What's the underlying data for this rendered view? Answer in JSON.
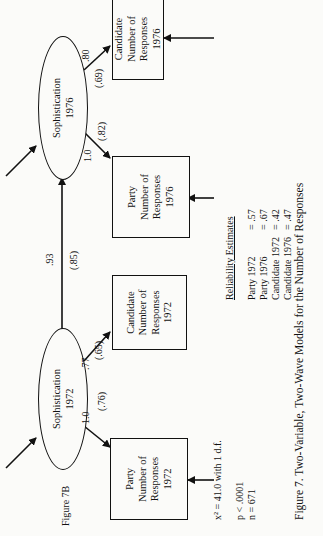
{
  "figure_label": "Figure 7B",
  "nodes": {
    "soph1972": {
      "line1": "Sophistication",
      "line2": "1972"
    },
    "soph1976": {
      "line1": "Sophistication",
      "line2": "1976"
    },
    "party1972": {
      "line1": "Party",
      "line2": "Number of",
      "line3": "Responses",
      "line4": "1972"
    },
    "cand1972": {
      "line1": "Candidate",
      "line2": "Number of",
      "line3": "Responses",
      "line4": "1972"
    },
    "party1976": {
      "line1": "Party",
      "line2": "Number of",
      "line3": "Responses",
      "line4": "1976"
    },
    "cand1976": {
      "line1": "Candidate",
      "line2": "Number of",
      "line3": "Responses",
      "line4": "1976"
    }
  },
  "paths": {
    "soph1972_party1972": {
      "coef": "1.0",
      "std": "(.76)"
    },
    "soph1972_cand1972": {
      "coef": ".77",
      "std": "(.65)"
    },
    "soph1972_soph1976": {
      "coef": ".93",
      "std": "(.85)"
    },
    "soph1976_party1976": {
      "coef": "1.0",
      "std": "(.82)"
    },
    "soph1976_cand1976": {
      "coef": ".80",
      "std": "(.69)"
    }
  },
  "stats": {
    "chi": "x² = 41.0 with 1 d.f.",
    "p": "p  <  .0001",
    "n": "n  = 671"
  },
  "reliability": {
    "title": "Reliability Estimates",
    "rows": [
      {
        "label": "Party 1972",
        "value": "= .57"
      },
      {
        "label": "Party 1976",
        "value": "= .67"
      },
      {
        "label": "Candidate 1972",
        "value": "= .42"
      },
      {
        "label": "Candidate 1976",
        "value": "= .47"
      }
    ]
  },
  "caption": "Figure 7.  Two-Variable, Two-Wave Models for the Number of Responses"
}
